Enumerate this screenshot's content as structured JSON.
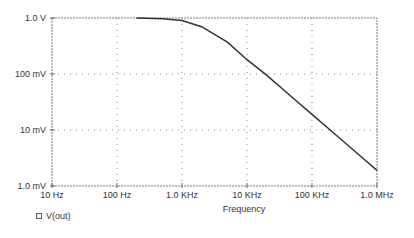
{
  "chart_data": {
    "type": "line",
    "title": "",
    "xlabel": "Frequency",
    "ylabel": "",
    "x_scale": "log",
    "y_scale": "log",
    "xlim": [
      10,
      1000000
    ],
    "ylim": [
      0.001,
      1.0
    ],
    "grid": true,
    "legend_position": "bottom-left",
    "x_ticks": [
      "10 Hz",
      "100 Hz",
      "1.0 KHz",
      "10 KHz",
      "100 KHz",
      "1.0 MHz"
    ],
    "y_ticks": [
      "1.0 V",
      "100 mV",
      "10 mV",
      "1.0 mV"
    ],
    "series": [
      {
        "name": "V(out)",
        "color": "#333333",
        "x": [
          200,
          500,
          1000,
          2000,
          5000,
          10000,
          20000,
          50000,
          100000,
          200000,
          500000,
          1000000
        ],
        "values": [
          0.995,
          0.97,
          0.9,
          0.7,
          0.37,
          0.18,
          0.095,
          0.038,
          0.019,
          0.0095,
          0.0038,
          0.0019
        ]
      }
    ]
  },
  "legend": {
    "items": [
      {
        "label": "V(out)"
      }
    ]
  }
}
